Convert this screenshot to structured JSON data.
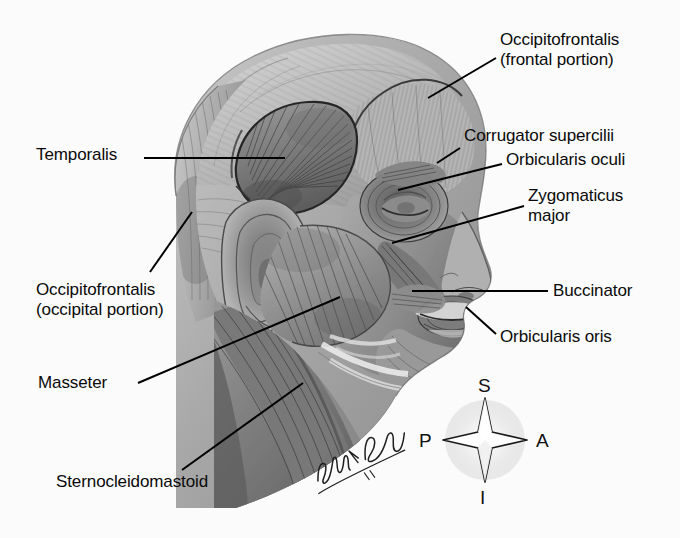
{
  "figure": {
    "medium": "grayscale pencil anatomical illustration",
    "background_color": "#fbfbfb",
    "text_color": "#0a0a0a",
    "leader_line_color": "#000000"
  },
  "labels": [
    {
      "id": "occipitofrontalis-frontal",
      "lines": [
        "Occipitofrontalis",
        "(frontal portion)"
      ],
      "text": "Occipitofrontalis\n(frontal portion)",
      "x": 500,
      "y": 30,
      "align": "left",
      "leader": {
        "x1": 496,
        "y1": 58,
        "x2": 428,
        "y2": 98
      }
    },
    {
      "id": "corrugator-supercilii",
      "lines": [
        "Corrugator supercilii"
      ],
      "text": "Corrugator supercilii",
      "x": 464,
      "y": 126,
      "align": "left",
      "leader": {
        "x1": 460,
        "y1": 148,
        "x2": 437,
        "y2": 163
      }
    },
    {
      "id": "orbicularis-oculi",
      "lines": [
        "Orbicularis oculi"
      ],
      "text": "Orbicularis oculi",
      "x": 506,
      "y": 150,
      "align": "left",
      "leader": {
        "x1": 502,
        "y1": 164,
        "x2": 398,
        "y2": 190
      }
    },
    {
      "id": "zygomaticus-major",
      "lines": [
        "Zygomaticus",
        "major"
      ],
      "text": "Zygomaticus\nmajor",
      "x": 528,
      "y": 186,
      "align": "left",
      "leader": {
        "x1": 524,
        "y1": 206,
        "x2": 392,
        "y2": 243
      }
    },
    {
      "id": "buccinator",
      "lines": [
        "Buccinator"
      ],
      "text": "Buccinator",
      "x": 553,
      "y": 281,
      "align": "left",
      "leader": {
        "x1": 548,
        "y1": 291,
        "x2": 412,
        "y2": 291
      }
    },
    {
      "id": "orbicularis-oris",
      "lines": [
        "Orbicularis oris"
      ],
      "text": "Orbicularis oris",
      "x": 500,
      "y": 327,
      "align": "left",
      "leader": {
        "x1": 496,
        "y1": 334,
        "x2": 466,
        "y2": 307
      }
    },
    {
      "id": "temporalis",
      "lines": [
        "Temporalis"
      ],
      "text": "Temporalis",
      "x": 36,
      "y": 145,
      "align": "left",
      "leader": {
        "x1": 144,
        "y1": 158,
        "x2": 285,
        "y2": 158
      }
    },
    {
      "id": "occipitofrontalis-occipital",
      "lines": [
        "Occipitofrontalis",
        "(occipital portion)"
      ],
      "text": "Occipitofrontalis\n(occipital portion)",
      "x": 36,
      "y": 280,
      "align": "left",
      "leader": {
        "x1": 150,
        "y1": 272,
        "x2": 192,
        "y2": 212
      }
    },
    {
      "id": "masseter",
      "lines": [
        "Masseter"
      ],
      "text": "Masseter",
      "x": 38,
      "y": 373,
      "align": "left",
      "leader": {
        "x1": 138,
        "y1": 383,
        "x2": 340,
        "y2": 297
      }
    },
    {
      "id": "sternocleidomastoid",
      "lines": [
        "Sternocleidomastoid"
      ],
      "text": "Sternocleidomastoid",
      "x": 56,
      "y": 472,
      "align": "left",
      "leader": {
        "x1": 182,
        "y1": 470,
        "x2": 303,
        "y2": 383
      }
    }
  ],
  "compass": {
    "name": "anatomical-orientation-compass",
    "center": {
      "x": 485,
      "y": 440
    },
    "superior": "S",
    "inferior": "I",
    "posterior": "P",
    "anterior": "A"
  },
  "signature": {
    "artist": "John V. Hagen",
    "year": "'81",
    "x": 310,
    "y": 468
  }
}
